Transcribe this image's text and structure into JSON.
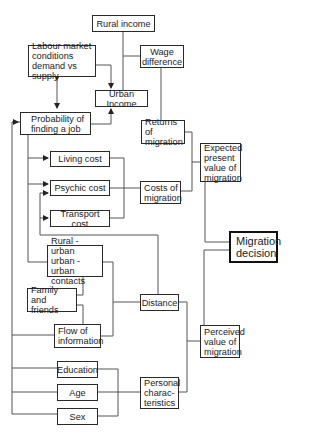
{
  "diagram": {
    "type": "flowchart",
    "nodes": {
      "rural_income": "Rural income",
      "wage_difference": "Wage\ndifference",
      "labour_market": "Labour market\nconditions\ndemand vs supply",
      "urban_income": "Urban Income",
      "probability_job": "Probability of\nfinding a job",
      "returns_migration": "Returns of\nmigration",
      "expected_value": "Expected\npresent\nvalue of\nmigration",
      "living_cost": "Living cost",
      "psychic_cost": "Psychic cost",
      "transport_cost": "Transport cost",
      "costs_migration": "Costs of\nmigration",
      "migration_decision": "Migration\ndecision",
      "contacts": "Rural - urban\nurban - urban\ncontacts",
      "family_friends": "Family and\nfriends",
      "flow_information": "Flow of\ninformation",
      "distance": "Distance",
      "perceived_value": "Perceived\nvalue of\nmigration",
      "education": "Education",
      "age": "Age",
      "sex": "Sex",
      "personal_characteristics": "Personal\ncharac-\nteristics"
    },
    "edges": [
      {
        "from": "rural_income",
        "to": "wage_difference"
      },
      {
        "from": "urban_income",
        "to": "wage_difference"
      },
      {
        "from": "labour_market",
        "to": "urban_income",
        "arrow": true
      },
      {
        "from": "labour_market",
        "to": "probability_job",
        "arrow": "both"
      },
      {
        "from": "probability_job",
        "to": "urban_income",
        "arrow": true
      },
      {
        "from": "wage_difference",
        "to": "returns_migration"
      },
      {
        "from": "returns_migration",
        "to": "expected_value"
      },
      {
        "from": "costs_migration",
        "to": "expected_value"
      },
      {
        "from": "living_cost",
        "to": "costs_migration"
      },
      {
        "from": "psychic_cost",
        "to": "costs_migration"
      },
      {
        "from": "transport_cost",
        "to": "costs_migration"
      },
      {
        "from": "expected_value",
        "to": "migration_decision"
      },
      {
        "from": "perceived_value",
        "to": "migration_decision"
      },
      {
        "from": "contacts",
        "to": "distance"
      },
      {
        "from": "family_friends",
        "to": "flow_information"
      },
      {
        "from": "flow_information",
        "to": "distance"
      },
      {
        "from": "distance",
        "to": "psychic_cost",
        "arrow": true
      },
      {
        "from": "distance",
        "to": "perceived_value"
      },
      {
        "from": "personal_characteristics",
        "to": "perceived_value"
      },
      {
        "from": "education",
        "to": "personal_characteristics"
      },
      {
        "from": "age",
        "to": "personal_characteristics"
      },
      {
        "from": "sex",
        "to": "personal_characteristics"
      }
    ]
  }
}
